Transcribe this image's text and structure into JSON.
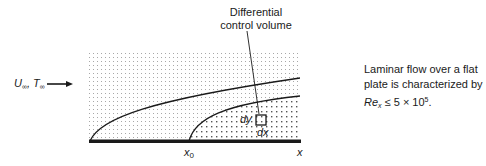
{
  "figure": {
    "callout": {
      "line1": "Differential",
      "line2": "control volume"
    },
    "freestream": {
      "velocity_symbol": "U",
      "velocity_sub": "∞",
      "separator": ", ",
      "temperature_symbol": "T",
      "temperature_sub": "∞"
    },
    "note": {
      "line1": "Laminar flow over a flat",
      "line2": "plate is characterized by",
      "re_symbol": "Re",
      "re_sub": "x",
      "relation": " ≤ 5 × 10",
      "exponent": "5",
      "end": "."
    },
    "axis": {
      "x0_symbol": "x",
      "x0_sub": "0",
      "x_label": "x"
    },
    "control_volume": {
      "dy_label": "dy",
      "dx_label": "dx"
    },
    "colors": {
      "line": "#1a1a1a",
      "dots_light": "#9a9a9a",
      "dots_dark": "#555555",
      "background": "#ffffff"
    }
  }
}
